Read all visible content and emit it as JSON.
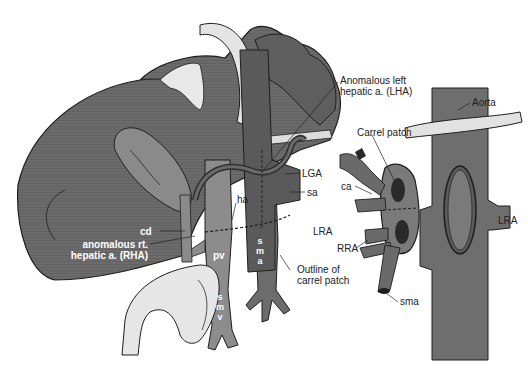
{
  "figure": {
    "colors": {
      "liver": "#6b6b6b",
      "liver_dark": "#4a4a4a",
      "vessel": "#7a7a7a",
      "vessel_dark": "#3a3a3a",
      "light": "#e6e6e6",
      "outline": "#1e1e1e",
      "text": "#222222"
    },
    "labels": {
      "lha": [
        "Anomalous left",
        "hepatic a. (LHA)"
      ],
      "aorta": "Aorta",
      "carrel_patch": "Carrel patch",
      "lga": "LGA",
      "sa": "sa",
      "ca": "ca",
      "ha": "ha",
      "lra_left": "LRA",
      "lra_right": "LRA",
      "rra": "RRA",
      "outline_patch": [
        "Outline of",
        "carrel patch"
      ],
      "cd": "cd",
      "rha": [
        "anomalous rt.",
        "hepatic a. (RHA)"
      ],
      "pv": "pv",
      "sma_vertical": [
        "s",
        "m",
        "a"
      ],
      "smv_vertical": [
        "s",
        "m",
        "v"
      ],
      "sma": "sma"
    }
  }
}
